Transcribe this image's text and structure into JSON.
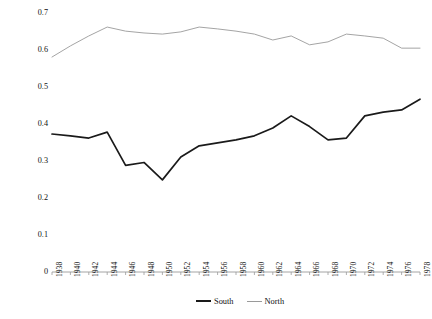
{
  "chart_data": {
    "type": "line",
    "title": "",
    "xlabel": "",
    "ylabel": "Difference in Mean Party DW-NOMINATE Score",
    "ylim": [
      0,
      0.7
    ],
    "yticks": [
      0,
      0.1,
      0.2,
      0.3,
      0.4,
      0.5,
      0.6,
      0.7
    ],
    "ytick_labels": [
      "0",
      "0.1",
      "0.2",
      "0.3",
      "0.4",
      "0.5",
      "0.6",
      "0.7"
    ],
    "grid": false,
    "legend_position": "bottom-right",
    "categories": [
      "1938",
      "1940",
      "1942",
      "1944",
      "1946",
      "1948",
      "1950",
      "1952",
      "1954",
      "1956",
      "1958",
      "1960",
      "1962",
      "1964",
      "1966",
      "1968",
      "1970",
      "1972",
      "1974",
      "1976",
      "1978"
    ],
    "series": [
      {
        "name": "South",
        "color": "#1a1a1a",
        "width": 1.7,
        "values": [
          0.373,
          0.368,
          0.362,
          0.378,
          0.288,
          0.296,
          0.249,
          0.311,
          0.341,
          0.349,
          0.357,
          0.368,
          0.389,
          0.422,
          0.393,
          0.357,
          0.362,
          0.422,
          0.432,
          0.438,
          0.467
        ]
      },
      {
        "name": "North",
        "color": "#9a9a9a",
        "width": 0.9,
        "values": [
          0.581,
          0.611,
          0.638,
          0.662,
          0.651,
          0.646,
          0.643,
          0.649,
          0.662,
          0.657,
          0.651,
          0.643,
          0.627,
          0.638,
          0.614,
          0.622,
          0.643,
          0.638,
          0.632,
          0.605,
          0.605
        ]
      }
    ]
  },
  "legend": {
    "items": [
      {
        "label": "South",
        "key": "south"
      },
      {
        "label": "North",
        "key": "north"
      }
    ]
  }
}
